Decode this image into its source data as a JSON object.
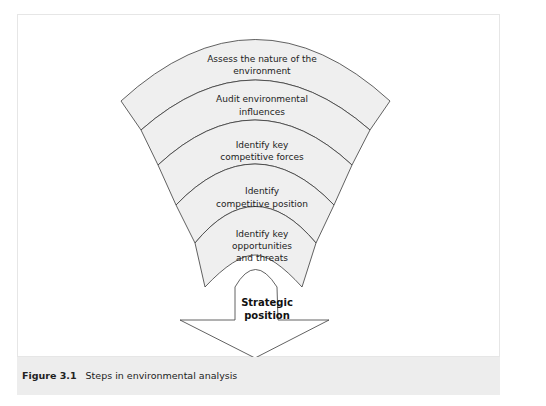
{
  "diagram": {
    "title": "Steps in environmental analysis",
    "steps": [
      {
        "line1": "Assess the nature of the",
        "line2": "environment"
      },
      {
        "line1": "Audit environmental",
        "line2": "influences"
      },
      {
        "line1": "Identify key",
        "line2": "competitive forces"
      },
      {
        "line1": "Identify",
        "line2": "competitive position"
      },
      {
        "line1": "Identify key",
        "line2": "opportunities",
        "line3": "and threats"
      }
    ],
    "outcome": {
      "line1": "Strategic",
      "line2": "position"
    },
    "colors": {
      "band_fill": "#efefef",
      "stroke": "#333333",
      "caption_band": "#ededed"
    }
  },
  "caption": {
    "label": "Figure 3.1",
    "text": "Steps in environmental analysis"
  }
}
